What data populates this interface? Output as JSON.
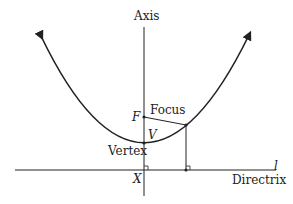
{
  "diagram": {
    "labels": {
      "axis": "Axis",
      "focus_point": "F",
      "focus": "Focus",
      "vertex_point": "V",
      "vertex": "Vertex",
      "foot": "X",
      "directrix_line": "l",
      "directrix": "Directrix"
    },
    "colors": {
      "stroke": "#222222",
      "text": "#222222",
      "background": "#ffffff"
    }
  }
}
